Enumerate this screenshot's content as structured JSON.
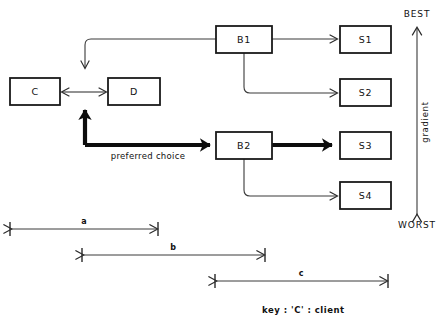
{
  "diagram": {
    "nodes": [
      {
        "id": "C",
        "label": "C",
        "x": 10,
        "y": 78,
        "w": 50,
        "h": 27
      },
      {
        "id": "D",
        "label": "D",
        "x": 108,
        "y": 78,
        "w": 52,
        "h": 27
      },
      {
        "id": "B1",
        "label": "B1",
        "x": 216,
        "y": 26,
        "w": 56,
        "h": 27
      },
      {
        "id": "B2",
        "label": "B2",
        "x": 216,
        "y": 132,
        "w": 56,
        "h": 27
      },
      {
        "id": "S1",
        "label": "S1",
        "x": 340,
        "y": 26,
        "w": 51,
        "h": 27
      },
      {
        "id": "S2",
        "label": "S2",
        "x": 340,
        "y": 79,
        "w": 51,
        "h": 27
      },
      {
        "id": "S3",
        "label": "S3",
        "x": 340,
        "y": 132,
        "w": 51,
        "h": 27
      },
      {
        "id": "S4",
        "label": "S4",
        "x": 340,
        "y": 182,
        "w": 51,
        "h": 27
      }
    ],
    "edge_captions": {
      "preferred_choice": "preferred choice"
    },
    "gradient_axis": {
      "top_label": "BEST",
      "bottom_label": "WORST",
      "side_label": "gradient"
    },
    "dimensions": [
      {
        "id": "a",
        "label": "a",
        "x1": 10,
        "x2": 158,
        "y": 229
      },
      {
        "id": "b",
        "label": "b",
        "x1": 82,
        "x2": 265,
        "y": 255
      },
      {
        "id": "c",
        "label": "c",
        "x1": 215,
        "x2": 388,
        "y": 281
      }
    ],
    "key": {
      "text": "key  :   'C' :  client"
    },
    "colors": {
      "background": "#ffffff",
      "stroke": "#1a1a1a",
      "thin_stroke": "#3a3a3a",
      "bold_stroke": "#0d0d0d",
      "text": "#111111"
    }
  }
}
